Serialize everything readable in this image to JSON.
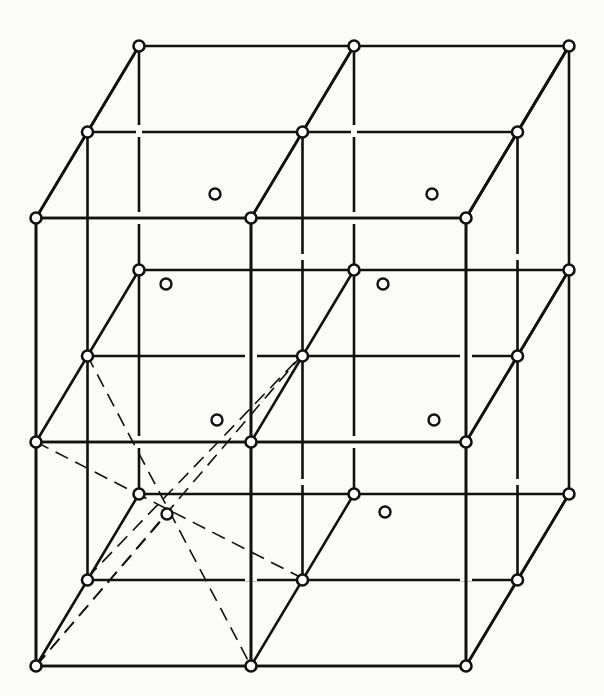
{
  "diagram": {
    "type": "crystal-lattice",
    "colors": {
      "line": "#111111",
      "node_fill": "#ffffff",
      "background": "#fbfbf9"
    },
    "projection": {
      "front_x": [
        36,
        251,
        466
      ],
      "front_y": [
        218,
        442,
        666
      ],
      "depth_offset": [
        51.5,
        -86
      ]
    },
    "lattice_nodes_count": 27,
    "face_atoms": [
      {
        "x": 215,
        "y": 194
      },
      {
        "x": 432,
        "y": 194
      },
      {
        "x": 166,
        "y": 284
      },
      {
        "x": 383,
        "y": 284
      },
      {
        "x": 217,
        "y": 420
      },
      {
        "x": 434,
        "y": 420
      },
      {
        "x": 385,
        "y": 512
      }
    ],
    "center_atom": {
      "x": 167,
      "y": 514
    },
    "dashed_lines": [
      {
        "from": [
          36,
          666
        ],
        "to": [
          302,
          355
        ]
      },
      {
        "from": [
          87,
          578
        ],
        "to": [
          302,
          355
        ]
      },
      {
        "from": [
          36,
          442
        ],
        "to": [
          302,
          578
        ]
      },
      {
        "from": [
          87,
          355
        ],
        "to": [
          251,
          666
        ]
      },
      {
        "from": [
          36,
          666
        ],
        "to": [
          167,
          514
        ]
      }
    ]
  }
}
